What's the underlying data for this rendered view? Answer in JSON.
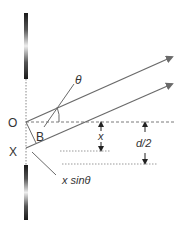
{
  "diagram": {
    "labels": {
      "origin": "O",
      "point_x": "X",
      "point_b": "B",
      "theta": "θ",
      "x": "x",
      "half_d": "d/2",
      "path_diff": "x sinθ"
    },
    "colors": {
      "line": "#6a6a6a",
      "dashed": "#7a7a7a",
      "text": "#333333",
      "slit_dark": "#1a1a1a",
      "slit_light": "#e6e6e6"
    }
  }
}
